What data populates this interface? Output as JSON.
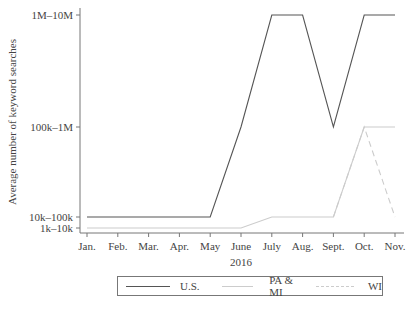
{
  "chart_data": {
    "type": "line",
    "title": "",
    "xlabel": "2016",
    "ylabel": "Average number of keyword searches",
    "categories": [
      "Jan.",
      "Feb.",
      "Mar.",
      "Apr.",
      "May",
      "June",
      "July",
      "Aug.",
      "Sept.",
      "Oct.",
      "Nov."
    ],
    "y_levels": [
      "1k–10k",
      "10k–100k",
      "100k–1M",
      "1M–10M"
    ],
    "series": [
      {
        "name": "U.S.",
        "values": [
          "10k–100k",
          "10k–100k",
          "10k–100k",
          "10k–100k",
          "10k–100k",
          "100k–1M",
          "1M–10M",
          "1M–10M",
          "100k–1M",
          "1M–10M",
          "1M–10M"
        ],
        "style": "solid",
        "color": "#555555"
      },
      {
        "name": "PA & MI",
        "values": [
          "1k–10k",
          "1k–10k",
          "1k–10k",
          "1k–10k",
          "1k–10k",
          "1k–10k",
          "10k–100k",
          "10k–100k",
          "10k–100k",
          "100k–1M",
          "100k–1M"
        ],
        "style": "solid",
        "color": "#cccccc"
      },
      {
        "name": "WI",
        "values": [
          "1k–10k",
          "1k–10k",
          "1k–10k",
          "1k–10k",
          "1k–10k",
          "1k–10k",
          "10k–100k",
          "10k–100k",
          "10k–100k",
          "100k–1M",
          "10k–100k"
        ],
        "style": "dashed",
        "color": "#cccccc"
      }
    ],
    "grid": false,
    "legend_position": "bottom"
  },
  "legend": {
    "items": [
      {
        "label": "U.S."
      },
      {
        "label": "PA & MI"
      },
      {
        "label": "WI"
      }
    ]
  }
}
